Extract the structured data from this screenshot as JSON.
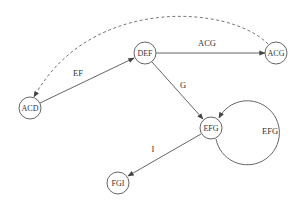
{
  "diagram": {
    "type": "state-graph",
    "style": {
      "stroke": "#555555",
      "fill": "#ffffff",
      "text": "#333333",
      "node_radius": 11
    },
    "nodes": [
      {
        "id": "ACD",
        "label": "ACD",
        "x": 30,
        "y": 108
      },
      {
        "id": "DEF",
        "label": "DEF",
        "x": 145,
        "y": 53
      },
      {
        "id": "ACG",
        "label": "ACG",
        "x": 276,
        "y": 53
      },
      {
        "id": "EFG",
        "label": "EFG",
        "x": 211,
        "y": 128
      },
      {
        "id": "FGI",
        "label": "FGI",
        "x": 118,
        "y": 183
      }
    ],
    "edges": [
      {
        "from": "ACD",
        "to": "DEF",
        "label": "EF",
        "style": "solid",
        "label_x": 78,
        "label_y": 76
      },
      {
        "from": "DEF",
        "to": "ACG",
        "label": "ACG",
        "style": "solid",
        "label_x": 207,
        "label_y": 46
      },
      {
        "from": "DEF",
        "to": "EFG",
        "label": "G",
        "style": "solid",
        "label_x": 183,
        "label_y": 88
      },
      {
        "from": "EFG",
        "to": "EFG",
        "label": "EFG",
        "style": "solid",
        "label_x": 270,
        "label_y": 134,
        "loop": true
      },
      {
        "from": "EFG",
        "to": "FGI",
        "label": "I",
        "style": "solid",
        "label_x": 153,
        "label_y": 152
      },
      {
        "from": "ACG",
        "to": "ACD",
        "label": "",
        "style": "dashed"
      }
    ]
  }
}
